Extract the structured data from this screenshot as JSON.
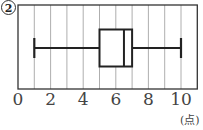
{
  "chart_data": {
    "type": "box",
    "title": "",
    "panel_label": "2",
    "xlabel": "",
    "unit_label": "(点)",
    "xlim": [
      0,
      11
    ],
    "x_ticks": [
      0,
      2,
      4,
      6,
      8,
      10
    ],
    "grid": "vertical lines at every integer",
    "box": {
      "min": 1,
      "q1": 5,
      "median": 6.5,
      "q3": 7,
      "max": 10
    }
  }
}
